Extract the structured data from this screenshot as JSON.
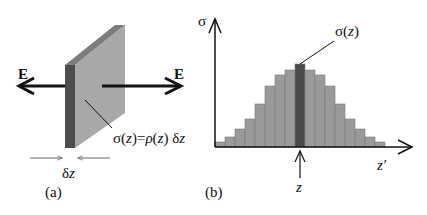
{
  "panel_a": {
    "label": "(a)",
    "field_left_label": "E",
    "field_right_label": "E",
    "thickness_label_delta": "δ",
    "thickness_label_z": "z",
    "equation": {
      "sigma": "σ(",
      "z1": "z",
      "eq": ")=",
      "rho": "ρ",
      "open": "(",
      "z2": "z",
      "close": ") δ",
      "z3": "z"
    }
  },
  "panel_b": {
    "label": "(b)",
    "y_axis_label": "σ",
    "x_axis_label": "z′",
    "marker_label": "z",
    "callout_sigma": "σ(",
    "callout_z": "z",
    "callout_close": ")"
  },
  "colors": {
    "bar_fill": "#9a9a9a",
    "bar_highlight": "#4a4a4a",
    "slab_face": "#a8a8a8",
    "slab_edge": "#4d4d4d",
    "slab_top": "#7d7d7d",
    "ink": "#111111"
  },
  "chart_data": {
    "type": "bar",
    "title": "",
    "xlabel": "z′",
    "ylabel": "σ",
    "highlighted_index": 8,
    "highlighted_label": "σ(z)",
    "categories": [
      "1",
      "2",
      "3",
      "4",
      "5",
      "6",
      "7",
      "8",
      "9",
      "10",
      "11",
      "12",
      "13",
      "14",
      "15",
      "16",
      "17"
    ],
    "values": [
      5,
      10,
      18,
      28,
      43,
      61,
      72,
      77,
      83,
      77,
      72,
      61,
      43,
      28,
      18,
      10,
      5
    ]
  }
}
